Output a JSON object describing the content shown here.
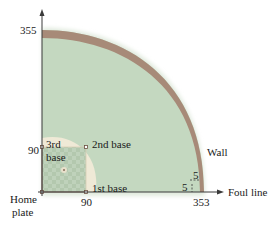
{
  "diagram": {
    "axes": {
      "y_axis_top_label": "355",
      "x_axis_label": "Foul line",
      "x_axis_wall_value": "353"
    },
    "bases": {
      "home": "Home plate",
      "home_line1": "Home",
      "home_line2": "plate",
      "first": "1st base",
      "second": "2nd base",
      "third_line1": "3rd",
      "third_line2": "base",
      "first_distance": "90",
      "third_distance": "90"
    },
    "wall": {
      "label": "Wall",
      "offset_horizontal": "5",
      "offset_vertical": "5"
    },
    "colors": {
      "grass": "#c4d8c0",
      "wall": "#a78a78",
      "infield_dirt": "#efe9d6",
      "infield_grass": "#bccfb8",
      "axis": "#3a3a3a",
      "baseline": "#8a6b5a"
    }
  }
}
